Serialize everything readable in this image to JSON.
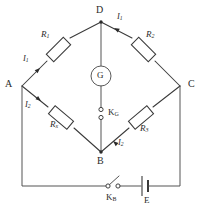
{
  "figure": {
    "background_color": "#ffffff",
    "line_color": "#3a3a3a",
    "width": 201,
    "height": 219
  },
  "nodes": [
    {
      "id": "A",
      "label": "A",
      "x": 22,
      "y": 86,
      "label_x": 5,
      "label_y": 80
    },
    {
      "id": "B",
      "label": "B",
      "x": 101,
      "y": 152,
      "label_x": 97,
      "label_y": 156
    },
    {
      "id": "C",
      "label": "C",
      "x": 180,
      "y": 86,
      "label_x": 188,
      "label_y": 80
    },
    {
      "id": "D",
      "label": "D",
      "x": 101,
      "y": 22,
      "label_x": 97,
      "label_y": 6
    }
  ],
  "components": {
    "r1": {
      "label": "R",
      "sub": "1",
      "branch": "A-D",
      "label_x": 43,
      "label_y": 33
    },
    "r2": {
      "label": "R",
      "sub": "2",
      "branch": "D-C",
      "label_x": 148,
      "label_y": 33
    },
    "rx": {
      "label": "R",
      "sub": "x",
      "branch": "A-B",
      "label_x": 52,
      "label_y": 121
    },
    "r3": {
      "label": "R",
      "sub": "3",
      "branch": "B-C",
      "label_x": 141,
      "label_y": 125
    },
    "galvanometer": {
      "label": "G",
      "x": 101,
      "y": 76,
      "radius": 10
    },
    "battery": {
      "label": "E",
      "x": 148,
      "y": 186
    },
    "switch_g": {
      "label": "K",
      "sub": "G",
      "x": 101,
      "y": 112
    },
    "switch_b": {
      "label": "K",
      "sub": "B",
      "x": 113,
      "y": 187
    }
  },
  "currents": [
    {
      "label": "I",
      "sub": "1",
      "branch": "A-D",
      "label_x": 24,
      "label_y": 57
    },
    {
      "label": "I",
      "sub": "1",
      "branch": "D-C",
      "label_x": 117,
      "label_y": 14
    },
    {
      "label": "I",
      "sub": "2",
      "branch": "A-B",
      "label_x": 26,
      "label_y": 103
    },
    {
      "label": "I",
      "sub": "2",
      "branch": "B-C",
      "label_x": 118,
      "label_y": 141
    }
  ],
  "icons": {
    "galvanometer": "galvanometer-icon",
    "battery": "battery-cell-icon",
    "switch": "open-switch-icon",
    "resistor": "resistor-icon",
    "current-arrow": "current-arrow-icon"
  }
}
